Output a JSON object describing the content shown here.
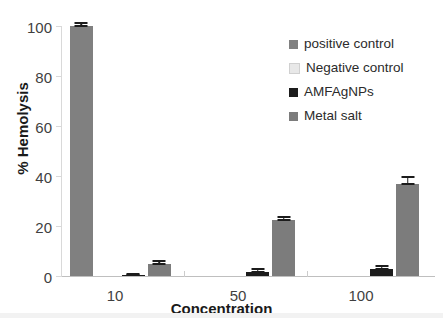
{
  "chart_data": {
    "type": "bar",
    "title": "",
    "xlabel": "Concentration",
    "ylabel": "% Hemolysis",
    "categories": [
      "10",
      "50",
      "100"
    ],
    "ylim": [
      0,
      100
    ],
    "yticks": [
      0,
      20,
      40,
      60,
      80,
      100
    ],
    "grid": false,
    "legend_position": "top-right",
    "series": [
      {
        "name": "positive control",
        "color": "#808080",
        "values": [
          100,
          null,
          null
        ],
        "errors": [
          0.6,
          null,
          null
        ]
      },
      {
        "name": "Negative control",
        "color": "#e8e8e8",
        "values": [
          0,
          null,
          null
        ],
        "errors": [
          0,
          null,
          null
        ]
      },
      {
        "name": "AMFAgNPs",
        "color": "#1c1c1c",
        "values": [
          0.4,
          1.8,
          2.8
        ],
        "errors": [
          0.2,
          0.5,
          0.7
        ]
      },
      {
        "name": "Metal salt",
        "color": "#7c7c7c",
        "values": [
          5.0,
          22.5,
          37.0
        ],
        "errors": [
          0.5,
          0.5,
          1.3
        ]
      }
    ]
  },
  "axis": {
    "y_title": "% Hemolysis",
    "x_title": "Concentration",
    "y_tick_labels": [
      "100",
      "80",
      "60",
      "40",
      "20",
      "0"
    ],
    "x_tick_labels": [
      "10",
      "50",
      "100"
    ]
  },
  "legend": {
    "items": [
      {
        "label": "positive control",
        "color": "#808080",
        "swatch": "legend-swatch-positive-control"
      },
      {
        "label": "Negative control",
        "color": "#e8e8e8",
        "swatch": "legend-swatch-negative-control"
      },
      {
        "label": "AMFAgNPs",
        "color": "#1c1c1c",
        "swatch": "legend-swatch-amfagnps"
      },
      {
        "label": "Metal salt",
        "color": "#7c7c7c",
        "swatch": "legend-swatch-metal-salt"
      }
    ]
  },
  "colors": {
    "background": "#ffffff",
    "axis_line": "#d9d9d9",
    "tick_text": "#3f3f3f",
    "title_text": "#1a1a1a",
    "error_bar": "#1c1c1c",
    "bottom_strip": "#f2f2f2"
  }
}
